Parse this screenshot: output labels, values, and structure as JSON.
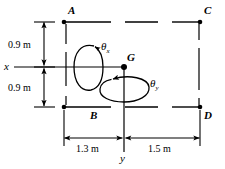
{
  "figure": {
    "type": "engineering-mechanics-diagram",
    "stroke_color": "#000000",
    "background_color": "#ffffff",
    "points": [
      {
        "name": "A",
        "label": "A",
        "x": 64,
        "y": 22
      },
      {
        "name": "B",
        "label": "B",
        "x": 64,
        "y": 107
      },
      {
        "name": "C",
        "label": "C",
        "x": 200,
        "y": 22
      },
      {
        "name": "D",
        "label": "D",
        "x": 200,
        "y": 107
      },
      {
        "name": "G",
        "label": "G",
        "x": 124,
        "y": 67
      }
    ],
    "axes": [
      {
        "name": "x-axis",
        "label": "x",
        "orientation": "horizontal",
        "y": 67
      },
      {
        "name": "y-axis",
        "label": "y",
        "orientation": "vertical",
        "x": 124
      }
    ],
    "rotations": [
      {
        "name": "theta-x",
        "symbol": "θ",
        "subscript": "x",
        "about": "x-axis",
        "direction": "clockwise-front"
      },
      {
        "name": "theta-y",
        "symbol": "θ",
        "subscript": "y",
        "about": "y-axis",
        "direction": "clockwise-front"
      }
    ],
    "dimensions": [
      {
        "name": "upper-vertical",
        "value": "0.9 m",
        "from": "x-axis",
        "to": "A-C line",
        "orientation": "vertical"
      },
      {
        "name": "lower-vertical",
        "value": "0.9 m",
        "from": "x-axis",
        "to": "B-D line",
        "orientation": "vertical"
      },
      {
        "name": "left-horizontal",
        "value": "1.3 m",
        "from": "B",
        "to": "y-axis",
        "orientation": "horizontal"
      },
      {
        "name": "right-horizontal",
        "value": "1.5 m",
        "from": "y-axis",
        "to": "D",
        "orientation": "horizontal"
      }
    ]
  }
}
